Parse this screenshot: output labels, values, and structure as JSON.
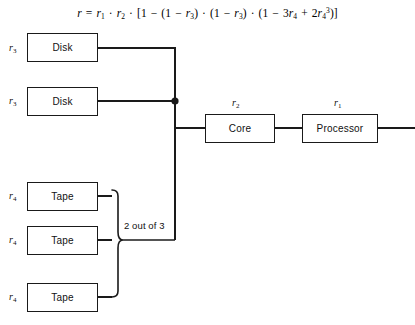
{
  "figure": {
    "formula": {
      "text": "r = r1 · r2 · [1 − (1 − r3) · (1 − r3) · (1 − 3r4 + 2r4^3)]",
      "lhs": "r",
      "equals": "=",
      "terms": [
        "r1",
        "r2",
        "[1 − (1 − r3) · (1 − r3) · (1 − 3r4 + 2r4³)]"
      ]
    },
    "blocks": [
      {
        "id": "disk-1",
        "label": "Disk",
        "reliability": "r3"
      },
      {
        "id": "disk-2",
        "label": "Disk",
        "reliability": "r3"
      },
      {
        "id": "tape-1",
        "label": "Tape",
        "reliability": "r4"
      },
      {
        "id": "tape-2",
        "label": "Tape",
        "reliability": "r4"
      },
      {
        "id": "tape-3",
        "label": "Tape",
        "reliability": "r4"
      },
      {
        "id": "core",
        "label": "Core",
        "reliability": "r2"
      },
      {
        "id": "processor",
        "label": "Processor",
        "reliability": "r1"
      }
    ],
    "annotations": {
      "voting": "2 out of 3"
    },
    "colors": {
      "line": "#1a1a1a",
      "text": "#111111",
      "background": "#ffffff"
    }
  }
}
